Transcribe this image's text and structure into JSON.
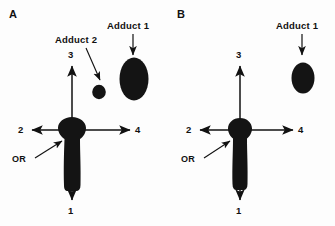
{
  "figure": {
    "background_color": "#fdfdfd",
    "ink_color": "#111111",
    "spot_color": "#141414"
  },
  "panels": [
    {
      "id": "A",
      "letter": "A",
      "origin_label": "OR",
      "axes": [
        {
          "id": "axis-1",
          "label": "1",
          "direction": "down"
        },
        {
          "id": "axis-2",
          "label": "2",
          "direction": "left"
        },
        {
          "id": "axis-3",
          "label": "3",
          "direction": "up"
        },
        {
          "id": "axis-4",
          "label": "4",
          "direction": "right"
        }
      ],
      "adducts": [
        {
          "id": "adduct-1",
          "label": "Adduct 1",
          "size": "large-oval"
        },
        {
          "id": "adduct-2",
          "label": "Adduct 2",
          "size": "small-round"
        }
      ]
    },
    {
      "id": "B",
      "letter": "B",
      "origin_label": "OR",
      "axes": [
        {
          "id": "axis-1",
          "label": "1",
          "direction": "down"
        },
        {
          "id": "axis-2",
          "label": "2",
          "direction": "left"
        },
        {
          "id": "axis-3",
          "label": "3",
          "direction": "up"
        },
        {
          "id": "axis-4",
          "label": "4",
          "direction": "right"
        }
      ],
      "adducts": [
        {
          "id": "adduct-1",
          "label": "Adduct 1",
          "size": "medium-oval"
        }
      ]
    }
  ]
}
